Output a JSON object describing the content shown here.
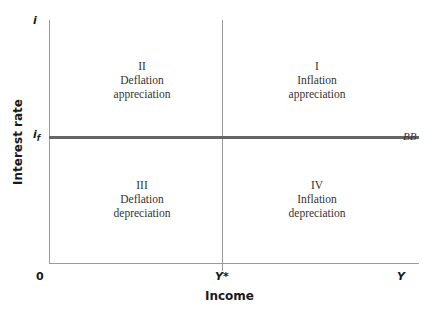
{
  "axes": {
    "y_label": "Interest rate",
    "x_label": "Income",
    "y_top": "i",
    "y_mid": "i",
    "y_mid_sub": "f",
    "origin": "0",
    "x_mid": "Y*",
    "x_end": "Y"
  },
  "curve": {
    "label": "BB"
  },
  "quadrants": [
    {
      "numeral": "I",
      "line1": "Inflation",
      "line2": "appreciation"
    },
    {
      "numeral": "II",
      "line1": "Deflation",
      "line2": "appreciation"
    },
    {
      "numeral": "III",
      "line1": "Deflation",
      "line2": "depreciation"
    },
    {
      "numeral": "IV",
      "line1": "Inflation",
      "line2": "depreciation"
    }
  ],
  "colors": {
    "axis": "#9a9a9a",
    "bb_line": "#666666",
    "text": "#333333"
  }
}
